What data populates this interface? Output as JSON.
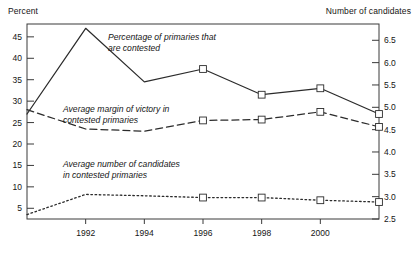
{
  "chart_data": {
    "type": "line",
    "title": "",
    "xlabel": "",
    "ylabel": "Percent",
    "ylabel_right": "Number of candidates",
    "x": [
      1990,
      1992,
      1994,
      1996,
      1998,
      2000,
      2002
    ],
    "xtick_labels": [
      "1992",
      "1994",
      "1996",
      "1998",
      "2000"
    ],
    "xticks": [
      1992,
      1994,
      1996,
      1998,
      2000
    ],
    "xlim": [
      1990,
      2002
    ],
    "ylim": [
      2.5,
      48
    ],
    "yticks_left": [
      5,
      10,
      15,
      20,
      25,
      30,
      35,
      40,
      45
    ],
    "ytick_labels_left": [
      "5",
      "10",
      "15",
      "20",
      "25",
      "30",
      "35",
      "40",
      "45"
    ],
    "yticks_right": [
      2.5,
      3.0,
      3.5,
      4.0,
      4.5,
      5.0,
      5.5,
      6.0,
      6.5
    ],
    "ytick_labels_right": [
      "2.5",
      "3.0",
      "3.5",
      "4.0",
      "4.5",
      "5.0",
      "5.5",
      "6.0",
      "6.5"
    ],
    "grid": false,
    "legend_position": "inline-annotations",
    "series": [
      {
        "name": "Percentage of primaries that are contested",
        "axis": "left",
        "style": "solid",
        "markers": [
          false,
          false,
          false,
          true,
          true,
          true,
          true
        ],
        "values": [
          27.0,
          47.0,
          34.5,
          37.5,
          31.5,
          33.0,
          27.0
        ]
      },
      {
        "name": "Average margin of victory in contested primaries",
        "axis": "left",
        "style": "dashed",
        "markers": [
          false,
          false,
          false,
          true,
          true,
          true,
          true
        ],
        "values": [
          28.0,
          23.5,
          23.0,
          25.5,
          25.7,
          27.5,
          24.0
        ]
      },
      {
        "name": "Average number of candidates in contested primaries",
        "axis": "right",
        "style": "dotted",
        "markers": [
          false,
          false,
          false,
          true,
          true,
          true,
          true
        ],
        "values": [
          2.6,
          3.05,
          3.02,
          2.98,
          2.98,
          2.92,
          2.88
        ]
      }
    ],
    "annotations": [
      {
        "id": "annot-contested",
        "line1": "Percentage of primaries that",
        "line2": "are contested"
      },
      {
        "id": "annot-margin",
        "line1": "Average margin of victory in",
        "line2": "contested primaries"
      },
      {
        "id": "annot-candidates",
        "line1": "Average number of candidates",
        "line2": "in contested primaries"
      }
    ],
    "colors": {
      "line": "#2b2b2b",
      "frame": "#3a3a3a",
      "text": "#151515",
      "background": "#ffffff"
    }
  }
}
